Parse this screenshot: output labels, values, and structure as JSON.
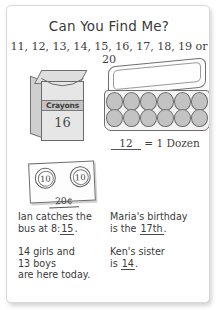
{
  "worksheet": {
    "title": "Can You Find Me?",
    "number_choices": "11, 12, 13, 14, 15, 16, 17, 18, 19 or 20",
    "crayon_box": {
      "brand_label": "Crayons",
      "count": "16"
    },
    "egg_carton": {
      "answer": "12",
      "equation_text": "= 1 Dozen",
      "egg_count": 12,
      "rows": 2,
      "columns": 6
    },
    "coin_card": {
      "coin_one": "10",
      "coin_two": "10",
      "total": "20¢"
    },
    "questions": [
      {
        "id": "ian-bus",
        "line1": "Ian catches the",
        "line2_before": "bus at 8:",
        "line2_blank": "15",
        "line2_after": "."
      },
      {
        "id": "maria-birthday",
        "line1": "Maria's birthday",
        "line2_before": "is the ",
        "line2_blank": "17th",
        "line2_after": "."
      },
      {
        "id": "class-count",
        "line1": "14 girls and",
        "line2": "13 boys",
        "line3": "are here today."
      },
      {
        "id": "ken-sister",
        "line1": "Ken's sister",
        "line2_before": "is ",
        "line2_blank": "14",
        "line2_after": "."
      }
    ]
  },
  "colors": {
    "ink": "#3a3a3a",
    "outline": "#6e6e6e",
    "egg_fill": "#c3c3c3",
    "box_fill": "#e6e6e6",
    "page": "#ffffff"
  }
}
